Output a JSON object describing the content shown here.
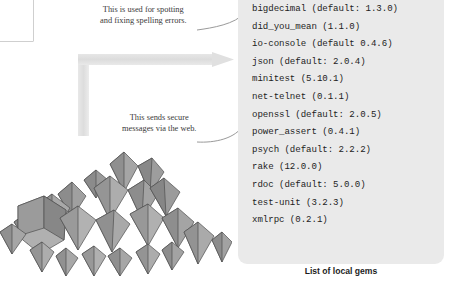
{
  "figure": {
    "clipped_box": {
      "partial_text": "ful"
    },
    "callouts": [
      {
        "id": "spelling",
        "line1": "This is used for spotting",
        "line2": "and fixing spelling errors.",
        "points_to": "did_you_mean (1.1.0)"
      },
      {
        "id": "secure",
        "line1": "This sends secure",
        "line2": "messages via the web.",
        "points_to": "openssl (default: 2.0.5)"
      }
    ],
    "illustration": {
      "name": "pile-of-gems",
      "description": "Grayscale pile of faceted gemstones"
    },
    "arrow": {
      "name": "grey-elbow-arrow",
      "direction": "up-then-right",
      "color": "#e2e2e2"
    }
  },
  "panel": {
    "background": "#eaeaea",
    "caption": "List of local gems",
    "gems": [
      "bigdecimal (default: 1.3.0)",
      "did_you_mean (1.1.0)",
      "io-console (default 0.4.6)",
      "json (default: 2.0.4)",
      "minitest (5.10.1)",
      "net-telnet (0.1.1)",
      "openssl (default: 2.0.5)",
      "power_assert (0.4.1)",
      "psych (default: 2.2.2)",
      "rake (12.0.0)",
      "rdoc (default: 5.0.0)",
      "test-unit (3.2.3)",
      "xmlrpc (0.2.1)"
    ]
  }
}
